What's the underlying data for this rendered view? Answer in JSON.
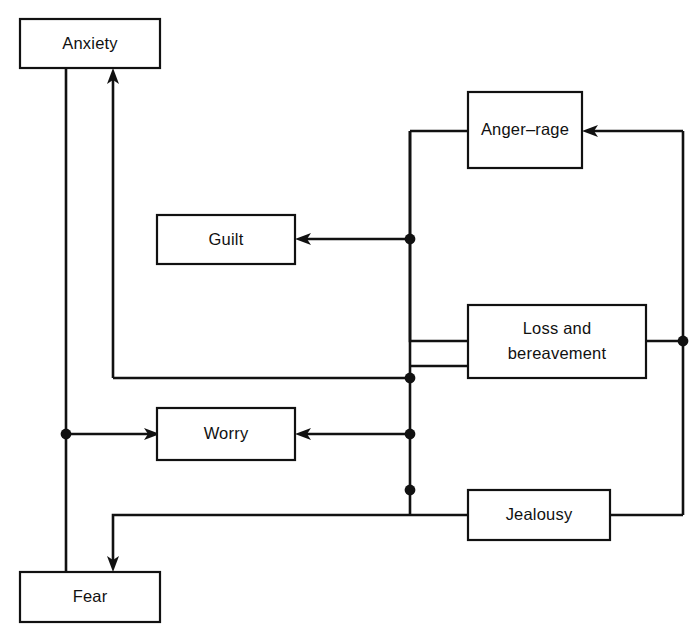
{
  "diagram": {
    "type": "block-flow-diagram",
    "background_color": "#ffffff",
    "line_color": "#111111",
    "box_fill_color": "#ffffff",
    "nodes": [
      {
        "id": "anxiety",
        "label": "Anxiety",
        "x": 20,
        "y": 19,
        "w": 140,
        "h": 49
      },
      {
        "id": "guilt",
        "label": "Guilt",
        "x": 157,
        "y": 215,
        "w": 138,
        "h": 49
      },
      {
        "id": "worry",
        "label": "Worry",
        "x": 157,
        "y": 408,
        "w": 138,
        "h": 52
      },
      {
        "id": "fear",
        "label": "Fear",
        "x": 20,
        "y": 572,
        "w": 140,
        "h": 50
      },
      {
        "id": "angerrage",
        "label": "Anger–rage",
        "x": 468,
        "y": 92,
        "w": 114,
        "h": 76
      },
      {
        "id": "loss",
        "label_line1": "Loss and",
        "label_line2": "bereavement",
        "x": 468,
        "y": 305,
        "w": 178,
        "h": 73
      },
      {
        "id": "jealousy",
        "label": "Jealousy",
        "x": 468,
        "y": 490,
        "w": 142,
        "h": 50
      }
    ],
    "junctions": [
      {
        "id": "j-guilt",
        "x": 410,
        "y": 239
      },
      {
        "id": "j-anxiety",
        "x": 410,
        "y": 378
      },
      {
        "id": "j-worry",
        "x": 410,
        "y": 434
      },
      {
        "id": "j-fear",
        "x": 410,
        "y": 490
      },
      {
        "id": "j-loss-out",
        "x": 683,
        "y": 341
      },
      {
        "id": "j-left",
        "x": 66,
        "y": 434
      }
    ],
    "edges": [
      {
        "id": "anxiety-to-fear",
        "from": "anxiety",
        "to": "fear",
        "arrow": false
      },
      {
        "id": "fear-path-to-anxiety",
        "from": "j-anxiety",
        "to": "anxiety",
        "arrow": true
      },
      {
        "id": "loss-bus-to-guilt",
        "from": "j-guilt",
        "to": "guilt",
        "arrow": true
      },
      {
        "id": "loss-bus-to-worry",
        "from": "j-worry",
        "to": "worry",
        "arrow": true
      },
      {
        "id": "left-bus-to-worry",
        "from": "j-left",
        "to": "worry",
        "arrow": true
      },
      {
        "id": "jealousy-bus-to-fear",
        "from": "j-fear",
        "to": "fear",
        "arrow": true
      },
      {
        "id": "bus-to-anger-rage",
        "from": "j-loss-out",
        "to": "angerrage",
        "arrow": true
      },
      {
        "id": "anger-rage-to-bus",
        "from": "angerrage",
        "to": "j-guilt",
        "arrow": false
      },
      {
        "id": "loss-to-bus-left",
        "from": "loss",
        "to": "j-anxiety",
        "arrow": false
      },
      {
        "id": "loss-to-bus-right",
        "from": "loss",
        "to": "j-loss-out",
        "arrow": false
      },
      {
        "id": "jealousy-to-bus-left",
        "from": "jealousy",
        "to": "j-fear",
        "arrow": false
      },
      {
        "id": "jealousy-to-bus-right",
        "from": "jealousy",
        "to": "j-loss-out",
        "arrow": false
      }
    ]
  }
}
